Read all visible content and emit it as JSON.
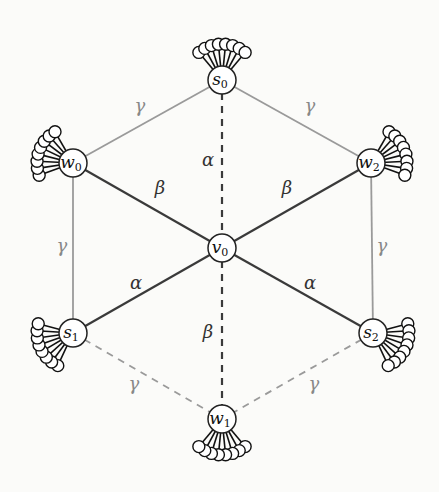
{
  "diagram": {
    "type": "graph",
    "nodes": [
      {
        "id": "s0",
        "label": "s",
        "sub": "0",
        "x": 222,
        "y": 80,
        "fan_angle": -90
      },
      {
        "id": "w0",
        "label": "w",
        "sub": "0",
        "x": 73,
        "y": 163,
        "fan_angle": -160
      },
      {
        "id": "w2",
        "label": "w",
        "sub": "2",
        "x": 371,
        "y": 163,
        "fan_angle": -20
      },
      {
        "id": "v0",
        "label": "v",
        "sub": "0",
        "x": 222,
        "y": 248,
        "fan_angle": null
      },
      {
        "id": "s1",
        "label": "s",
        "sub": "1",
        "x": 73,
        "y": 333,
        "fan_angle": 155
      },
      {
        "id": "s2",
        "label": "s",
        "sub": "2",
        "x": 373,
        "y": 333,
        "fan_angle": 25
      },
      {
        "id": "w1",
        "label": "w",
        "sub": "1",
        "x": 222,
        "y": 419,
        "fan_angle": 90
      }
    ],
    "edges": [
      {
        "from": "s0",
        "to": "w0",
        "label": "γ",
        "style": "solid",
        "color": "#9a9a9a",
        "lx": 140,
        "ly": 112
      },
      {
        "from": "s0",
        "to": "w2",
        "label": "γ",
        "style": "solid",
        "color": "#9a9a9a",
        "lx": 310,
        "ly": 112
      },
      {
        "from": "w0",
        "to": "s1",
        "label": "γ",
        "style": "solid",
        "color": "#9a9a9a",
        "lx": 62,
        "ly": 252
      },
      {
        "from": "w2",
        "to": "s2",
        "label": "γ",
        "style": "solid",
        "color": "#9a9a9a",
        "lx": 382,
        "ly": 252
      },
      {
        "from": "w0",
        "to": "v0",
        "label": "β",
        "style": "solid",
        "color": "#3a3a3a",
        "lx": 160,
        "ly": 194
      },
      {
        "from": "w2",
        "to": "v0",
        "label": "β",
        "style": "solid",
        "color": "#3a3a3a",
        "lx": 287,
        "ly": 194
      },
      {
        "from": "v0",
        "to": "s1",
        "label": "α",
        "style": "solid",
        "color": "#3a3a3a",
        "lx": 136,
        "ly": 289
      },
      {
        "from": "v0",
        "to": "s2",
        "label": "α",
        "style": "solid",
        "color": "#3a3a3a",
        "lx": 310,
        "ly": 289
      },
      {
        "from": "s0",
        "to": "v0",
        "label": "α",
        "style": "dashed",
        "color": "#3a3a3a",
        "lx": 208,
        "ly": 166
      },
      {
        "from": "v0",
        "to": "w1",
        "label": "β",
        "style": "dashed",
        "color": "#3a3a3a",
        "lx": 208,
        "ly": 338
      },
      {
        "from": "s1",
        "to": "w1",
        "label": "γ",
        "style": "dashed",
        "color": "#9a9a9a",
        "lx": 134,
        "ly": 390
      },
      {
        "from": "s2",
        "to": "w1",
        "label": "γ",
        "style": "dashed",
        "color": "#9a9a9a",
        "lx": 314,
        "ly": 390
      }
    ],
    "colors": {
      "background": "#fbfbf9",
      "dark_edge": "#3a3a3a",
      "light_edge": "#9a9a9a",
      "node_stroke": "#222222",
      "node_fill": "#ffffff"
    },
    "leaf_fan": {
      "count": 8,
      "leaf_radius": 6,
      "distance": 36,
      "spread_deg": 80
    }
  }
}
